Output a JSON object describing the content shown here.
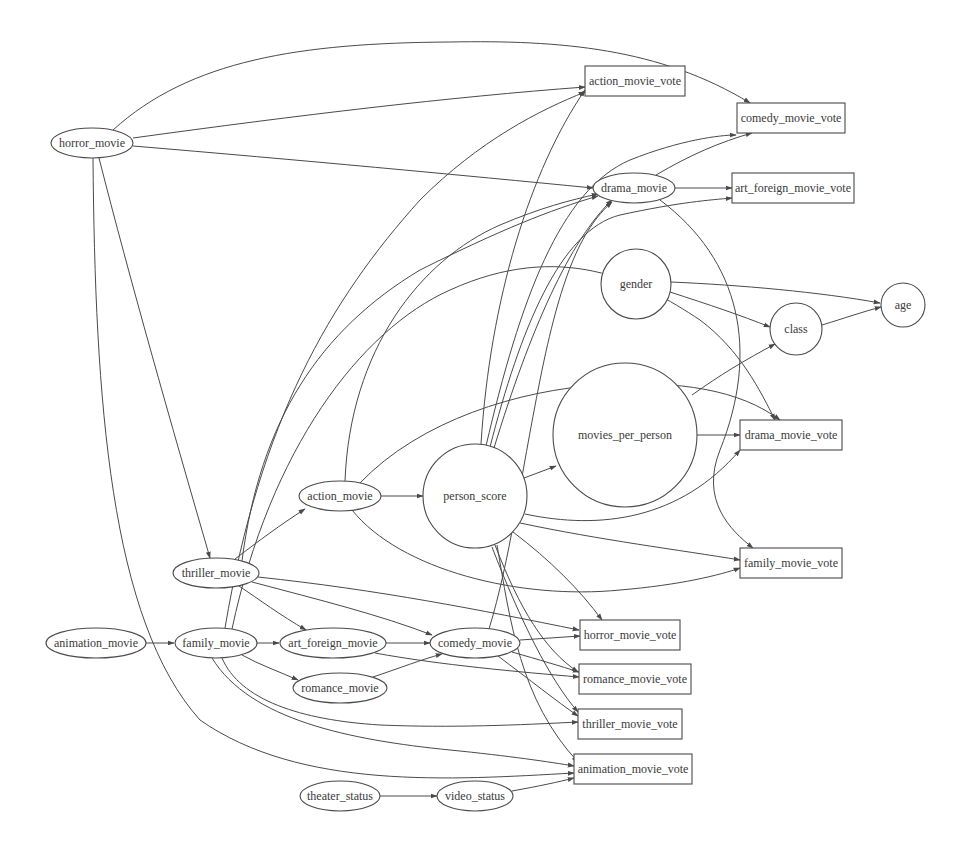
{
  "diagram": {
    "type": "directed-graph",
    "nodes": [
      {
        "id": "horror_movie",
        "label": "horror_movie",
        "shape": "ellipse",
        "x": 92,
        "y": 143,
        "rx": 41,
        "ry": 15
      },
      {
        "id": "action_movie_vote",
        "label": "action_movie_vote",
        "shape": "box",
        "x": 635,
        "y": 81,
        "w": 100,
        "h": 30
      },
      {
        "id": "comedy_movie_vote",
        "label": "comedy_movie_vote",
        "shape": "box",
        "x": 791,
        "y": 118,
        "w": 108,
        "h": 30
      },
      {
        "id": "drama_movie",
        "label": "drama_movie",
        "shape": "ellipse",
        "x": 634,
        "y": 188,
        "rx": 41,
        "ry": 15
      },
      {
        "id": "art_foreign_movie_vote",
        "label": "art_foreign_movie_vote",
        "shape": "box",
        "x": 793,
        "y": 188,
        "w": 122,
        "h": 30
      },
      {
        "id": "gender",
        "label": "gender",
        "shape": "circle",
        "x": 636,
        "y": 284,
        "r": 35
      },
      {
        "id": "class",
        "label": "class",
        "shape": "circle",
        "x": 796,
        "y": 329,
        "r": 26
      },
      {
        "id": "age",
        "label": "age",
        "shape": "circle",
        "x": 903,
        "y": 305,
        "r": 22
      },
      {
        "id": "movies_per_person",
        "label": "movies_per_person",
        "shape": "circle",
        "x": 625,
        "y": 435,
        "r": 72
      },
      {
        "id": "drama_movie_vote",
        "label": "drama_movie_vote",
        "shape": "box",
        "x": 791,
        "y": 435,
        "w": 102,
        "h": 30
      },
      {
        "id": "action_movie",
        "label": "action_movie",
        "shape": "ellipse",
        "x": 340,
        "y": 496,
        "rx": 41,
        "ry": 15
      },
      {
        "id": "person_score",
        "label": "person_score",
        "shape": "circle",
        "x": 475,
        "y": 496,
        "r": 52
      },
      {
        "id": "family_movie_vote",
        "label": "family_movie_vote",
        "shape": "box",
        "x": 791,
        "y": 563,
        "w": 102,
        "h": 30
      },
      {
        "id": "thriller_movie",
        "label": "thriller_movie",
        "shape": "ellipse",
        "x": 216,
        "y": 573,
        "rx": 43,
        "ry": 15
      },
      {
        "id": "animation_movie",
        "label": "animation_movie",
        "shape": "ellipse",
        "x": 96,
        "y": 643,
        "rx": 50,
        "ry": 15
      },
      {
        "id": "family_movie",
        "label": "family_movie",
        "shape": "ellipse",
        "x": 216,
        "y": 643,
        "rx": 41,
        "ry": 15
      },
      {
        "id": "art_foreign_movie",
        "label": "art_foreign_movie",
        "shape": "ellipse",
        "x": 333,
        "y": 643,
        "rx": 53,
        "ry": 15
      },
      {
        "id": "comedy_movie",
        "label": "comedy_movie",
        "shape": "ellipse",
        "x": 475,
        "y": 643,
        "rx": 45,
        "ry": 15
      },
      {
        "id": "horror_movie_vote",
        "label": "horror_movie_vote",
        "shape": "box",
        "x": 630,
        "y": 635,
        "w": 100,
        "h": 30
      },
      {
        "id": "romance_movie",
        "label": "romance_movie",
        "shape": "ellipse",
        "x": 340,
        "y": 688,
        "rx": 47,
        "ry": 15
      },
      {
        "id": "romance_movie_vote",
        "label": "romance_movie_vote",
        "shape": "box",
        "x": 635,
        "y": 679,
        "w": 112,
        "h": 30
      },
      {
        "id": "thriller_movie_vote",
        "label": "thriller_movie_vote",
        "shape": "box",
        "x": 630,
        "y": 724,
        "w": 104,
        "h": 30
      },
      {
        "id": "animation_movie_vote",
        "label": "animation_movie_vote",
        "shape": "box",
        "x": 633,
        "y": 769,
        "w": 118,
        "h": 30
      },
      {
        "id": "theater_status",
        "label": "theater_status",
        "shape": "ellipse",
        "x": 340,
        "y": 796,
        "rx": 40,
        "ry": 15
      },
      {
        "id": "video_status",
        "label": "video_status",
        "shape": "ellipse",
        "x": 475,
        "y": 796,
        "rx": 38,
        "ry": 15
      }
    ],
    "edges": [
      {
        "from": "horror_movie",
        "to": "comedy_movie_vote",
        "d": "M113,130 C190,60 300,43 450,42 C560,40 660,48 750,103"
      },
      {
        "from": "horror_movie",
        "to": "action_movie_vote",
        "d": "M133,138 C300,115 450,97 585,87"
      },
      {
        "from": "horror_movie",
        "to": "drama_movie",
        "d": "M133,146 C300,160 460,175 593,188"
      },
      {
        "from": "horror_movie",
        "to": "thriller_movie",
        "d": "M99,158 C130,280 170,420 210,558"
      },
      {
        "from": "horror_movie",
        "to": "animation_movie_vote",
        "d": "M93,158 C95,400 110,620 200,720 C300,790 450,780 574,773"
      },
      {
        "from": "drama_movie",
        "to": "comedy_movie_vote",
        "d": "M656,175 C690,155 720,142 752,133"
      },
      {
        "from": "drama_movie",
        "to": "art_foreign_movie_vote",
        "d": "M675,188 L732,188"
      },
      {
        "from": "drama_movie",
        "to": "family_movie_vote",
        "d": "M660,200 C740,260 760,350 720,450 C700,500 730,530 753,548"
      },
      {
        "from": "gender",
        "to": "age",
        "d": "M671,282 C740,285 820,292 880,303"
      },
      {
        "from": "gender",
        "to": "class",
        "d": "M670,292 C710,305 740,315 770,327"
      },
      {
        "from": "class",
        "to": "age",
        "d": "M822,325 C845,318 862,312 881,307"
      },
      {
        "from": "movies_per_person",
        "to": "class",
        "d": "M692,395 C720,375 745,360 775,344"
      },
      {
        "from": "movies_per_person",
        "to": "drama_movie_vote",
        "d": "M697,435 L740,435"
      },
      {
        "from": "action_movie",
        "to": "person_score",
        "d": "M381,496 L423,496"
      },
      {
        "from": "action_movie",
        "to": "drama_movie",
        "d": "M345,481 C350,350 420,260 500,225 C540,208 570,200 598,194"
      },
      {
        "from": "action_movie",
        "to": "drama_movie_vote",
        "d": "M360,483 C420,420 520,390 600,385 C680,380 740,390 780,420"
      },
      {
        "from": "action_movie",
        "to": "family_movie_vote",
        "d": "M352,510 C400,570 520,600 620,590 C680,585 720,575 740,568"
      },
      {
        "from": "person_score",
        "to": "movies_per_person",
        "d": "M524,478 L556,466"
      },
      {
        "from": "person_score",
        "to": "action_movie_vote",
        "d": "M481,444 C490,300 530,170 585,90"
      },
      {
        "from": "person_score",
        "to": "comedy_movie_vote",
        "d": "M486,446 C520,300 560,190 630,160 C680,140 720,135 736,135"
      },
      {
        "from": "person_score",
        "to": "art_foreign_movie_vote",
        "d": "M490,447 C520,330 560,230 620,215 C680,202 710,200 732,198"
      },
      {
        "from": "person_score",
        "to": "drama_movie",
        "d": "M494,448 C530,330 570,240 612,200"
      },
      {
        "from": "person_score",
        "to": "drama_movie_vote",
        "d": "M525,514 C600,530 680,520 740,450"
      },
      {
        "from": "person_score",
        "to": "family_movie_vote",
        "d": "M520,523 C600,540 680,550 740,560"
      },
      {
        "from": "person_score",
        "to": "horror_movie_vote",
        "d": "M513,532 C550,560 580,590 602,620"
      },
      {
        "from": "person_score",
        "to": "romance_movie_vote",
        "d": "M495,545 C520,610 545,650 578,672"
      },
      {
        "from": "person_score",
        "to": "thriller_movie_vote",
        "d": "M492,547 C520,620 550,680 578,712"
      },
      {
        "from": "person_score",
        "to": "animation_movie_vote",
        "d": "M497,545 C510,620 520,700 578,762"
      },
      {
        "from": "thriller_movie",
        "to": "action_movie",
        "d": "M235,559 C260,540 280,525 305,509"
      },
      {
        "from": "thriller_movie",
        "to": "art_foreign_movie",
        "d": "M239,586 C260,600 280,615 306,630"
      },
      {
        "from": "thriller_movie",
        "to": "comedy_movie",
        "d": "M252,582 C320,600 380,615 432,635"
      },
      {
        "from": "thriller_movie",
        "to": "horror_movie_vote",
        "d": "M258,577 C380,590 480,610 579,630"
      },
      {
        "from": "thriller_movie",
        "to": "drama_movie",
        "d": "M242,561 C260,420 320,330 420,270 C500,230 550,210 598,196"
      },
      {
        "from": "animation_movie",
        "to": "family_movie",
        "d": "M146,643 L174,643"
      },
      {
        "from": "family_movie",
        "to": "art_foreign_movie",
        "d": "M257,643 L279,643"
      },
      {
        "from": "family_movie",
        "to": "romance_movie",
        "d": "M242,655 C260,665 280,672 298,680"
      },
      {
        "from": "family_movie",
        "to": "action_movie_vote",
        "d": "M225,628 C260,420 330,300 420,200 C480,140 540,110 585,92"
      },
      {
        "from": "family_movie",
        "to": "drama_movie_vote",
        "d": "M232,629 C270,450 360,330 450,290 C560,240 640,280 700,320 C740,350 760,390 775,420"
      },
      {
        "from": "family_movie",
        "to": "thriller_movie_vote",
        "d": "M222,658 C240,700 300,720 380,725 C450,728 520,725 578,722"
      },
      {
        "from": "family_movie",
        "to": "animation_movie_vote",
        "d": "M212,658 C250,720 350,740 450,750 C510,756 550,762 574,766"
      },
      {
        "from": "art_foreign_movie",
        "to": "comedy_movie",
        "d": "M386,643 L430,643"
      },
      {
        "from": "art_foreign_movie",
        "to": "romance_movie_vote",
        "d": "M375,653 C440,665 520,672 579,677"
      },
      {
        "from": "romance_movie",
        "to": "comedy_movie",
        "d": "M373,677 C400,668 420,660 442,654"
      },
      {
        "from": "comedy_movie",
        "to": "horror_movie_vote",
        "d": "M520,640 L580,636"
      },
      {
        "from": "comedy_movie",
        "to": "romance_movie_vote",
        "d": "M512,652 C540,660 560,666 579,672"
      },
      {
        "from": "comedy_movie",
        "to": "thriller_movie_vote",
        "d": "M498,656 C530,680 555,700 578,716"
      },
      {
        "from": "comedy_movie",
        "to": "drama_movie",
        "d": "M489,629 C510,560 520,480 540,380 C560,280 580,230 612,202"
      },
      {
        "from": "theater_status",
        "to": "video_status",
        "d": "M380,796 L437,796"
      },
      {
        "from": "video_status",
        "to": "animation_movie_vote",
        "d": "M512,791 C540,786 558,782 574,778"
      }
    ]
  }
}
